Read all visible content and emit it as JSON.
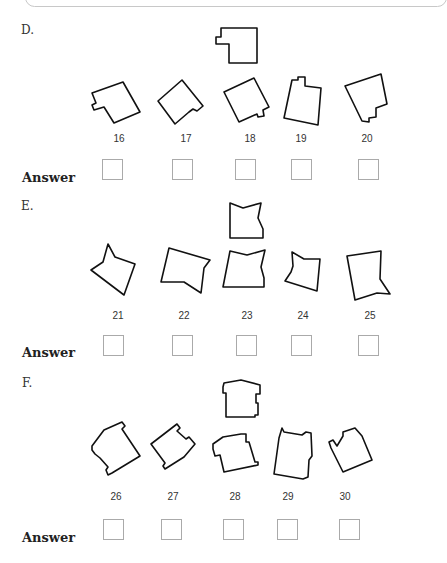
{
  "sections": [
    {
      "label": "D.",
      "answer_label": "Answer",
      "items": [
        {
          "number": "16"
        },
        {
          "number": "17"
        },
        {
          "number": "18"
        },
        {
          "number": "19"
        },
        {
          "number": "20"
        }
      ]
    },
    {
      "label": "E.",
      "answer_label": "Answer",
      "items": [
        {
          "number": "21"
        },
        {
          "number": "22"
        },
        {
          "number": "23"
        },
        {
          "number": "24"
        },
        {
          "number": "25"
        }
      ]
    },
    {
      "label": "F.",
      "answer_label": "Answer",
      "items": [
        {
          "number": "26"
        },
        {
          "number": "27"
        },
        {
          "number": "28"
        },
        {
          "number": "29"
        },
        {
          "number": "30"
        }
      ]
    }
  ]
}
